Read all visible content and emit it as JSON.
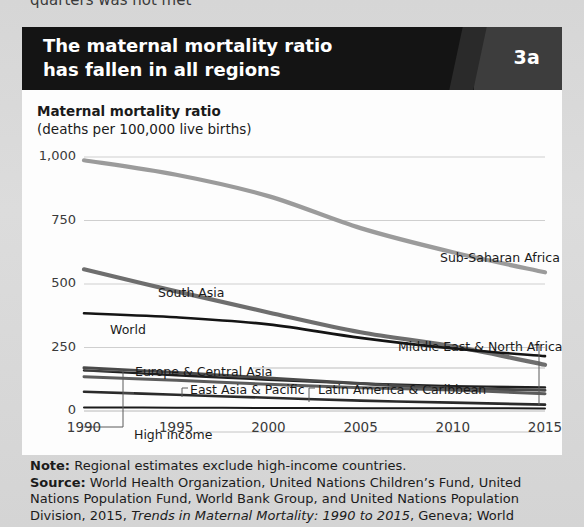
{
  "page": {
    "cutoff_text": "quarters was not met"
  },
  "header": {
    "title_line1": "The maternal mortality ratio",
    "title_line2": "has fallen in all regions",
    "badge": "3a"
  },
  "footer": {
    "note_label": "Note:",
    "note_text": " Regional estimates exclude high-income countries.",
    "source_label": "Source:",
    "source_text_1": " World Health Organization, United Nations Children’s Fund, United",
    "source_text_2": "Nations Population Fund, World Bank Group, and United Nations Population",
    "source_text_3_a": "Division, 2015, ",
    "source_text_3_italic": "Trends in Maternal Mortality: 1990 to 2015",
    "source_text_3_b": ", Geneva; World"
  },
  "chart_data": {
    "type": "line",
    "title": "The maternal mortality ratio has fallen in all regions",
    "ylabel": "Maternal mortality ratio",
    "ylabel_sub": "(deaths per 100,000 live births)",
    "xlabel": "",
    "xlim": [
      1990,
      2015
    ],
    "ylim": [
      0,
      1000
    ],
    "yticks": [
      0,
      250,
      500,
      750,
      1000
    ],
    "ytick_labels": [
      "0",
      "250",
      "500",
      "750",
      "1,000"
    ],
    "xticks": [
      1990,
      1995,
      2000,
      2005,
      2010,
      2015
    ],
    "xtick_labels": [
      "1990",
      "1995",
      "2000",
      "2005",
      "2010",
      "2015"
    ],
    "grid": true,
    "legend_position": "inline-labels",
    "x": [
      1990,
      1995,
      2000,
      2005,
      2010,
      2015
    ],
    "series": [
      {
        "name": "Sub-Saharan Africa",
        "color": "#9b9b9b",
        "width": 4.2,
        "values": [
          987,
          930,
          846,
          720,
          625,
          546
        ],
        "label_x": 418,
        "label_y": 223
      },
      {
        "name": "South Asia",
        "color": "#6e6e6e",
        "width": 4.2,
        "values": [
          558,
          471,
          388,
          310,
          255,
          182
        ],
        "label_x": 136,
        "label_y": 258
      },
      {
        "name": "World",
        "color": "#141414",
        "width": 2.6,
        "values": [
          385,
          369,
          341,
          288,
          246,
          216
        ],
        "label_x": 88,
        "label_y": 295
      },
      {
        "name": "Middle East & North Africa",
        "color": "#1f1f1f",
        "width": 2.4,
        "values": [
          160,
          141,
          123,
          108,
          98,
          93
        ],
        "label_x": 376,
        "label_y": 312
      },
      {
        "name": "Europe & Central Asia",
        "color": "#2a2a2a",
        "width": 2.6,
        "values": [
          76,
          64,
          52,
          41,
          33,
          25
        ],
        "label_x": 113,
        "label_y": 337
      },
      {
        "name": "East Asia & Pacific",
        "color": "#4a4a4a",
        "width": 3.0,
        "values": [
          170,
          152,
          130,
          108,
          90,
          82
        ],
        "label_x": 168,
        "label_y": 355
      },
      {
        "name": "Latin America & Caribbean",
        "color": "#5c5c5c",
        "width": 3.0,
        "values": [
          135,
          121,
          105,
          92,
          83,
          68
        ],
        "label_x": 296,
        "label_y": 355
      },
      {
        "name": "High income",
        "color": "#1a1a1a",
        "width": 2.0,
        "values": [
          14,
          13,
          12,
          11,
          11,
          10
        ],
        "label_x": 112,
        "label_y": 400
      }
    ]
  }
}
